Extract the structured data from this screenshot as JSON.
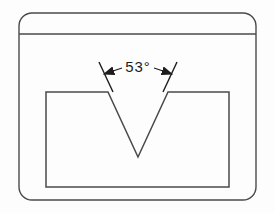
{
  "drawing": {
    "title": "V-notch groove cross-section drawing",
    "background_color": "#fdfdfd",
    "line_color": "#4a4a4a",
    "text_color": "#1c1c1c",
    "annotation": {
      "label": "53°",
      "value": 53,
      "unit": "degrees",
      "x": 138,
      "y": 72
    },
    "outer_frame": {
      "name": "rounded-border-frame",
      "x": 19,
      "y": 13,
      "width": 237,
      "height": 187,
      "corner_radius": 13
    },
    "divider_line": {
      "name": "header-divider",
      "x1": 19,
      "y1": 34,
      "x2": 256,
      "y2": 34
    },
    "inner_rectangle": {
      "name": "workpiece-body",
      "x": 46,
      "y": 92,
      "width": 183,
      "height": 95
    },
    "v_notch": {
      "name": "v-groove",
      "left_x": 108,
      "right_x": 168,
      "top_y": 92,
      "apex_x": 138,
      "apex_y": 157
    },
    "extension_lines": {
      "left": {
        "x1": 99,
        "y1": 62,
        "x2": 113,
        "y2": 92
      },
      "right": {
        "x1": 177,
        "y1": 62,
        "x2": 163,
        "y2": 92
      }
    },
    "leader_arrows": {
      "left": {
        "tail_x": 122,
        "tail_y": 68,
        "tip_x": 104,
        "tip_y": 74
      },
      "right": {
        "tail_x": 154,
        "tail_y": 68,
        "tip_x": 172,
        "tip_y": 74
      }
    }
  }
}
